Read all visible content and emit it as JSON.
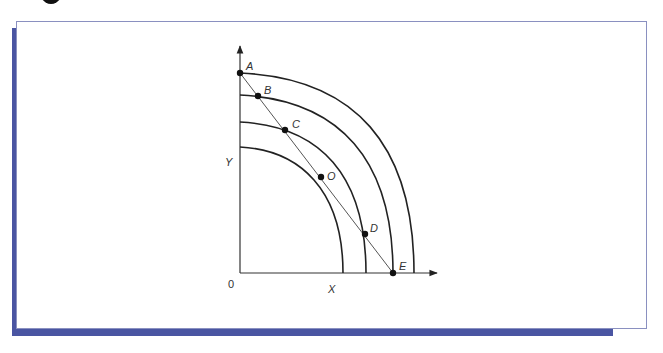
{
  "diagram": {
    "axes": {
      "x_label": "X",
      "y_label": "Y",
      "origin_label": "0"
    },
    "curves": [
      {
        "name": "innermost-frontier"
      },
      {
        "name": "inner-frontier"
      },
      {
        "name": "outer-frontier"
      },
      {
        "name": "outermost-frontier"
      }
    ],
    "budget_line": {
      "from": "A",
      "to": "E"
    },
    "points": [
      {
        "label": "A"
      },
      {
        "label": "B"
      },
      {
        "label": "C"
      },
      {
        "label": "O"
      },
      {
        "label": "D"
      },
      {
        "label": "E"
      }
    ],
    "colors": {
      "frame_shadow": "#4a55a2",
      "frame_border": "#8a90c0",
      "ink": "#222222"
    }
  }
}
